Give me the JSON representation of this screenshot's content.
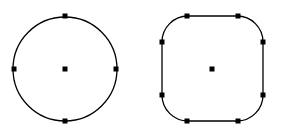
{
  "colors": {
    "stroke": "#000000",
    "handle": "#000000",
    "background": "#ffffff"
  },
  "shapes": [
    {
      "type": "circle",
      "center": [
        65,
        69
      ],
      "radius": 52,
      "handles": [
        [
          65,
          16
        ],
        [
          116,
          69
        ],
        [
          65,
          121
        ],
        [
          14,
          69
        ]
      ]
    },
    {
      "type": "rounded-square",
      "x": 162,
      "y": 16,
      "width": 101,
      "height": 105,
      "corner_radius": 26,
      "center": [
        212,
        69
      ],
      "handles": [
        [
          187,
          16
        ],
        [
          238,
          16
        ],
        [
          263,
          42
        ],
        [
          263,
          95
        ],
        [
          238,
          121
        ],
        [
          187,
          121
        ],
        [
          162,
          95
        ],
        [
          162,
          42
        ]
      ]
    }
  ]
}
